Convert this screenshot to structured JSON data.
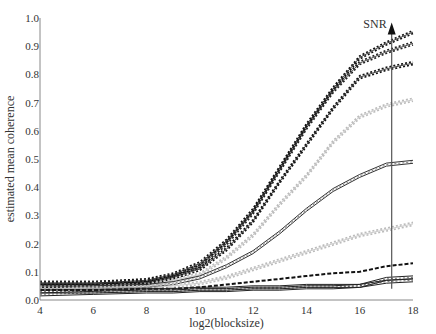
{
  "chart_data": {
    "type": "line",
    "title": "",
    "xlabel": "log2(blocksize)",
    "ylabel": "estimated mean coherence",
    "xlim": [
      4,
      18
    ],
    "ylim": [
      0.0,
      1.0
    ],
    "xticks": [
      4,
      6,
      8,
      10,
      12,
      14,
      16,
      18
    ],
    "yticks": [
      0.0,
      0.1,
      0.2,
      0.3,
      0.4,
      0.5,
      0.6,
      0.7,
      0.8,
      0.9,
      1.0
    ],
    "ytick_labels": [
      "0.0",
      "0.1",
      "0.2",
      "0.3",
      "0.4",
      "0.5",
      "0.6",
      "0.7",
      "0.8",
      "0.9",
      "1.0"
    ],
    "grid": false,
    "legend": null,
    "annotation": {
      "text": "SNR",
      "x": 17.2,
      "arrow_from": 0.04,
      "arrow_to": 0.97,
      "direction": "up"
    },
    "x": [
      4,
      6,
      8,
      9,
      10,
      11,
      12,
      13,
      14,
      15,
      16,
      17,
      18
    ],
    "series": [
      {
        "name": "series-1",
        "color": "#111111",
        "style": "dotted-band",
        "values": [
          0.06,
          0.06,
          0.07,
          0.09,
          0.13,
          0.21,
          0.32,
          0.47,
          0.62,
          0.75,
          0.86,
          0.91,
          0.95
        ]
      },
      {
        "name": "series-2",
        "color": "#222222",
        "style": "dotted-band",
        "values": [
          0.06,
          0.06,
          0.065,
          0.085,
          0.12,
          0.2,
          0.31,
          0.46,
          0.61,
          0.74,
          0.84,
          0.88,
          0.91
        ]
      },
      {
        "name": "series-3",
        "color": "#111111",
        "style": "dotted-band",
        "values": [
          0.05,
          0.05,
          0.06,
          0.08,
          0.11,
          0.18,
          0.28,
          0.42,
          0.55,
          0.68,
          0.79,
          0.82,
          0.84
        ]
      },
      {
        "name": "series-4",
        "color": "#bbbbbb",
        "style": "dotted-band",
        "values": [
          0.04,
          0.045,
          0.05,
          0.07,
          0.09,
          0.15,
          0.23,
          0.34,
          0.44,
          0.56,
          0.65,
          0.69,
          0.71
        ]
      },
      {
        "name": "series-5",
        "color": "#333333",
        "style": "double-line",
        "values": [
          0.04,
          0.045,
          0.05,
          0.06,
          0.08,
          0.12,
          0.17,
          0.24,
          0.32,
          0.39,
          0.44,
          0.48,
          0.49
        ]
      },
      {
        "name": "series-6",
        "color": "#bbbbbb",
        "style": "dotted-band",
        "values": [
          0.04,
          0.04,
          0.045,
          0.05,
          0.06,
          0.08,
          0.11,
          0.14,
          0.17,
          0.2,
          0.23,
          0.25,
          0.27
        ]
      },
      {
        "name": "series-7",
        "color": "#111111",
        "style": "dashed-band",
        "values": [
          0.035,
          0.035,
          0.04,
          0.04,
          0.045,
          0.055,
          0.065,
          0.075,
          0.085,
          0.095,
          0.1,
          0.12,
          0.13
        ]
      },
      {
        "name": "series-8",
        "color": "#222222",
        "style": "double-line",
        "values": [
          0.03,
          0.03,
          0.035,
          0.035,
          0.04,
          0.04,
          0.045,
          0.045,
          0.05,
          0.05,
          0.05,
          0.075,
          0.08
        ]
      },
      {
        "name": "series-9",
        "color": "#222222",
        "style": "double-line",
        "values": [
          0.02,
          0.025,
          0.03,
          0.03,
          0.035,
          0.035,
          0.04,
          0.04,
          0.045,
          0.045,
          0.05,
          0.065,
          0.07
        ]
      }
    ]
  },
  "layout": {
    "plot": {
      "left": 40,
      "right": 413,
      "top": 18,
      "bottom": 300
    },
    "axis_color": "#888888"
  }
}
